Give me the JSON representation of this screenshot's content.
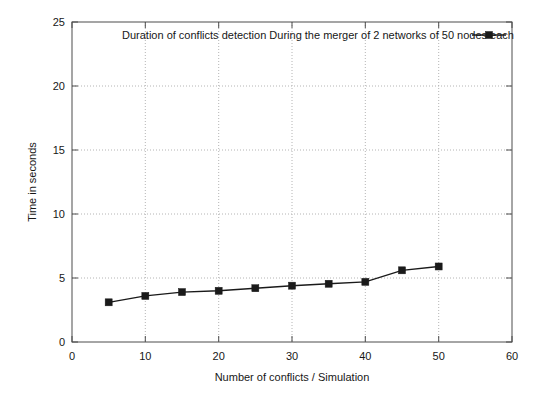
{
  "chart_data": {
    "type": "line",
    "title": "",
    "xlabel": "Number of conflicts / Simulation",
    "ylabel": "Time in seconds",
    "xlim": [
      0,
      60
    ],
    "ylim": [
      0,
      25
    ],
    "xticks": [
      0,
      10,
      20,
      30,
      40,
      50,
      60
    ],
    "yticks": [
      0,
      5,
      10,
      15,
      20,
      25
    ],
    "xtick_labels": [
      "0",
      "10",
      "20",
      "30",
      "40",
      "50",
      "60"
    ],
    "ytick_labels": [
      "0",
      "5",
      "10",
      "15",
      "20",
      "25"
    ],
    "grid": true,
    "grid_style": "dotted",
    "legend_position": "top-inside",
    "marker": "square",
    "line_color": "#1a1a1a",
    "series": [
      {
        "name": "Duration of conflicts detection During the merger of 2 networks of 50 nodes each",
        "x": [
          5,
          10,
          15,
          20,
          25,
          30,
          35,
          40,
          45,
          50
        ],
        "values": [
          3.1,
          3.6,
          3.9,
          4.0,
          4.2,
          4.4,
          4.55,
          4.7,
          5.6,
          5.9
        ]
      }
    ]
  },
  "legend": {
    "entries": [
      {
        "label": "Duration of conflicts detection During the merger of 2 networks of 50 nodes each",
        "marker": "square",
        "color": "#1a1a1a"
      }
    ]
  },
  "axes": {
    "x_axis_title": "Number of conflicts / Simulation",
    "y_axis_title": "Time in seconds"
  }
}
